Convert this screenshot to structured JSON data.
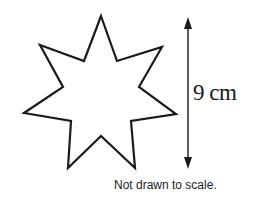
{
  "figure": {
    "shape": "seven-pointed star",
    "measurement_label": "9 cm",
    "measurement_value": 9,
    "measurement_unit": "cm",
    "note": "Not drawn to scale."
  },
  "colors": {
    "stroke": "#1a1a1a",
    "background": "#ffffff"
  }
}
